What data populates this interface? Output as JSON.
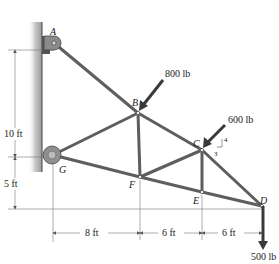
{
  "diagram": {
    "type": "truss",
    "joints": [
      {
        "id": "A",
        "label": "A",
        "x": 54,
        "y": 43
      },
      {
        "id": "B",
        "label": "B",
        "x": 138,
        "y": 113
      },
      {
        "id": "C",
        "label": "C",
        "x": 202,
        "y": 150
      },
      {
        "id": "D",
        "label": "D",
        "x": 262,
        "y": 206
      },
      {
        "id": "E",
        "label": "E",
        "x": 202,
        "y": 192
      },
      {
        "id": "F",
        "label": "F",
        "x": 140,
        "y": 177
      },
      {
        "id": "G",
        "label": "G",
        "x": 53,
        "y": 155
      }
    ],
    "members": [
      "AB",
      "BC",
      "CD",
      "GF",
      "FE",
      "ED",
      "GB",
      "BF",
      "FC",
      "CE"
    ],
    "loads": [
      {
        "joint": "B",
        "label": "800 lb"
      },
      {
        "joint": "C",
        "label": "600 lb",
        "slope": {
          "rise": "4",
          "run": "3"
        }
      },
      {
        "joint": "D",
        "label": "500 lb"
      }
    ],
    "dimensions": {
      "vertical": [
        "10 ft",
        "5 ft"
      ],
      "horizontal": [
        "8 ft",
        "6 ft",
        "6 ft"
      ]
    },
    "colors": {
      "member": "#6b6b6b",
      "member_dark": "#3a3a3a",
      "wall": "#b8b8b8",
      "load_arrow": "#3a3a3a"
    }
  }
}
